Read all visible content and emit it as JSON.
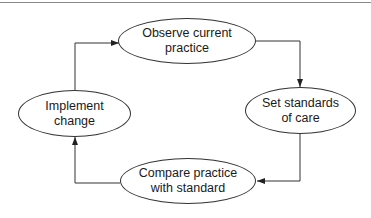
{
  "diagram": {
    "type": "cycle",
    "nodes": [
      {
        "id": "observe",
        "label": "Observe current\npractice"
      },
      {
        "id": "set",
        "label": "Set standards\nof care"
      },
      {
        "id": "compare",
        "label": "Compare practice\nwith standard"
      },
      {
        "id": "implement",
        "label": "Implement\nchange"
      }
    ],
    "edges": [
      {
        "from": "observe",
        "to": "set"
      },
      {
        "from": "set",
        "to": "compare"
      },
      {
        "from": "compare",
        "to": "implement"
      },
      {
        "from": "implement",
        "to": "observe"
      }
    ],
    "colors": {
      "stroke": "#333333",
      "background": "#ffffff",
      "rule": "#8a8a8a"
    }
  }
}
